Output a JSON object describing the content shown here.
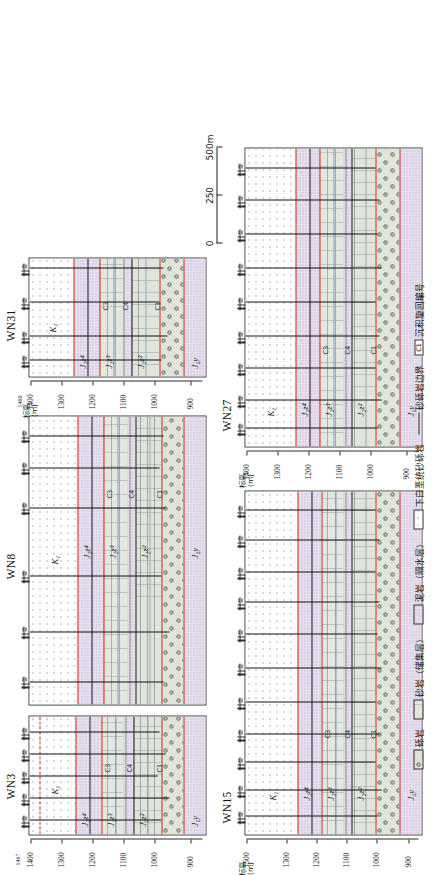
{
  "figure": {
    "axis_caption": "标高\n(m)",
    "axis_caption_line1": "标高",
    "axis_caption_line2": "(m)",
    "elevation_unit": "m"
  },
  "panels": [
    {
      "id": "wn3",
      "well_name": "WN3",
      "axis_labels": [
        "1400",
        "1300",
        "1200",
        "1100",
        "1000",
        "900"
      ],
      "axis_top_value": "1467",
      "strat_labels": [
        "K₁",
        "J₂z⁴",
        "J₂z³",
        "J₂z²",
        "J₂z¹",
        "J₁y"
      ],
      "cycle_labels": [
        "C3",
        "C4",
        "C1"
      ],
      "well_count": 8
    },
    {
      "id": "wn8",
      "well_name": "WN8",
      "axis_labels": [
        "1400",
        "1300",
        "1200",
        "1100",
        "1000",
        "900"
      ],
      "strat_labels": [
        "K₁",
        "J₂z⁴",
        "J₂z³",
        "J₂z²",
        "J₂z¹",
        "J₁y"
      ],
      "cycle_labels": [
        "C3",
        "C4",
        "C1"
      ],
      "well_count": 9
    },
    {
      "id": "wn31",
      "well_name": "WN31",
      "axis_caption_line1": "标高",
      "axis_caption_line2": "(m)",
      "axis_labels": [
        "1400",
        "1300",
        "1200",
        "1100",
        "1000",
        "900"
      ],
      "axis_top_value": "1460",
      "strat_labels": [
        "K₁",
        "J₂z⁴",
        "J₂z³",
        "J₂z²",
        "J₂z¹",
        "J₁y"
      ],
      "cycle_labels": [
        "C3",
        "C4",
        "C1"
      ],
      "well_count": 4
    },
    {
      "id": "wn15",
      "well_name": "WN15",
      "axis_caption_line1": "标高",
      "axis_caption_line2": "(m)",
      "axis_labels": [
        "1500",
        "1300",
        "1200",
        "1100",
        "1000",
        "900"
      ],
      "strat_labels": [
        "K₁",
        "J₂z⁴",
        "J₂z³",
        "J₂z²",
        "J₂z¹",
        "J₁y"
      ],
      "cycle_labels": [
        "C3",
        "C4",
        "C1"
      ],
      "well_count": 13
    },
    {
      "id": "wn27",
      "well_name": "WN27",
      "axis_caption_line1": "标高",
      "axis_caption_line2": "(m)",
      "axis_labels": [
        "1400",
        "1300",
        "1200",
        "1100",
        "1000",
        "900"
      ],
      "strat_labels": [
        "K₁",
        "J₂z⁴",
        "J₂z³",
        "J₂z²",
        "J₂z¹",
        "J₁y"
      ],
      "cycle_labels": [
        "C3",
        "C4",
        "C1"
      ],
      "well_count": 11
    }
  ],
  "scale_bar": {
    "ticks": [
      "0",
      "250",
      "500m"
    ],
    "unit": "m"
  },
  "legend": {
    "items": [
      {
        "label": "砾岩",
        "swatch": "conglomerate"
      },
      {
        "label": "砂岩（储集层）",
        "swatch": "sandstone"
      },
      {
        "label": "泥岩（隔水层）",
        "swatch": "mudstone"
      },
      {
        "label": "下白垩统砂砾岩",
        "swatch": "cretaceous-sandgravel"
      },
      {
        "label": "砂砾岩边界",
        "swatch": "boundary-line"
      },
      {
        "label": "沉积旋回编号",
        "swatch": "cycle-box",
        "box_text": "C1"
      }
    ]
  },
  "colors": {
    "boundary_red": "#e02a16",
    "boundary_black": "#1b1b1b",
    "mudstone": "#e7dff0",
    "sandstone": "#e4e7e0",
    "conglomerate": "#dfe3d8"
  }
}
